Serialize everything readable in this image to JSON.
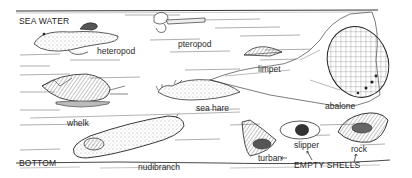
{
  "zones": {
    "top": "SEA WATER",
    "bottom": "BOTTOM"
  },
  "organisms": [
    {
      "id": "heteropod",
      "label": "heteropod"
    },
    {
      "id": "pteropod",
      "label": "pteropod"
    },
    {
      "id": "limpet",
      "label": "limpet"
    },
    {
      "id": "abalone",
      "label": "abalone"
    },
    {
      "id": "whelk",
      "label": "whelk"
    },
    {
      "id": "sea-hare",
      "label": "sea hare"
    },
    {
      "id": "nudibranch",
      "label": "nudibranch"
    }
  ],
  "empty_shells": {
    "group_label": "EMPTY SHELLS",
    "items": [
      {
        "id": "turban",
        "label": "turban"
      },
      {
        "id": "slipper",
        "label": "slipper"
      },
      {
        "id": "rock",
        "label": "rock"
      }
    ]
  },
  "colors": {
    "ink": "#2a2a2a",
    "paper": "#ffffff",
    "shade": "#8a8a8a"
  }
}
